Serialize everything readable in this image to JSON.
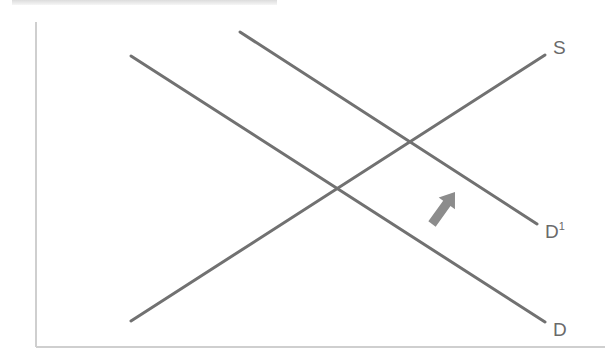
{
  "diagram": {
    "type": "supply-demand-shift",
    "colors": {
      "line": "#717171",
      "axis": "#cfcfcf",
      "arrow": "#8c8c8c",
      "label": "#6a6a6a",
      "top_band": "#dcdcdc"
    },
    "axes": {
      "y_axis": {
        "x": 36,
        "y1": 22,
        "y2": 347
      },
      "x_axis": {
        "y": 347,
        "x1": 36,
        "x2": 605
      }
    },
    "curves": [
      {
        "id": "S",
        "label": "S",
        "sup": "",
        "x1": 131,
        "y1": 321,
        "x2": 545,
        "y2": 55,
        "label_x": 553,
        "label_y": 54
      },
      {
        "id": "D1",
        "label": "D",
        "sup": "1",
        "x1": 240,
        "y1": 32,
        "x2": 537,
        "y2": 224,
        "label_x": 545,
        "label_y": 238
      },
      {
        "id": "D",
        "label": "D",
        "sup": "",
        "x1": 131,
        "y1": 56,
        "x2": 545,
        "y2": 322,
        "label_x": 553,
        "label_y": 336
      }
    ],
    "shift_arrow": {
      "direction": "up-right",
      "tail_x": 432,
      "tail_y": 224,
      "tip_x": 455,
      "tip_y": 192
    },
    "labels": {
      "supply": "S",
      "demand": "D",
      "demand_shifted": "D",
      "demand_shifted_sup": "1"
    }
  }
}
